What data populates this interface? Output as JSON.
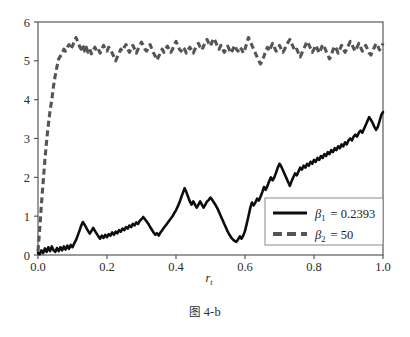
{
  "caption": {
    "prefix": "图",
    "text": "4-b"
  },
  "chart_data": {
    "type": "line",
    "title": "",
    "xlabel": "r_t",
    "xlabel_base": "r",
    "xlabel_sub": "t",
    "ylabel": "",
    "xlim": [
      0.0,
      1.0
    ],
    "ylim": [
      0,
      6
    ],
    "xticks": [
      0.0,
      0.2,
      0.4,
      0.6,
      0.8,
      1.0
    ],
    "xtick_labels": [
      "0.0",
      "0.2",
      "0.4",
      "0.6",
      "0.8",
      "1.0"
    ],
    "yticks": [
      0,
      1,
      2,
      3,
      4,
      5,
      6
    ],
    "ytick_labels": [
      "0",
      "1",
      "2",
      "3",
      "4",
      "5",
      "6"
    ],
    "grid": false,
    "legend_position": "lower right",
    "series": [
      {
        "name": "beta1",
        "label_base": "β",
        "label_sub": "1",
        "label_value": "= 0.2393",
        "label": "β₁ = 0.2393",
        "style": "solid",
        "color": "#0d0d0d",
        "x": [
          0.0,
          0.005,
          0.01,
          0.015,
          0.02,
          0.025,
          0.03,
          0.035,
          0.04,
          0.045,
          0.05,
          0.055,
          0.06,
          0.065,
          0.07,
          0.075,
          0.08,
          0.085,
          0.09,
          0.095,
          0.1,
          0.105,
          0.11,
          0.115,
          0.12,
          0.125,
          0.13,
          0.135,
          0.14,
          0.145,
          0.15,
          0.155,
          0.16,
          0.165,
          0.17,
          0.175,
          0.18,
          0.185,
          0.19,
          0.195,
          0.2,
          0.205,
          0.21,
          0.215,
          0.22,
          0.225,
          0.23,
          0.235,
          0.24,
          0.245,
          0.25,
          0.255,
          0.26,
          0.265,
          0.27,
          0.275,
          0.28,
          0.285,
          0.29,
          0.295,
          0.3,
          0.305,
          0.31,
          0.315,
          0.32,
          0.325,
          0.33,
          0.335,
          0.34,
          0.345,
          0.35,
          0.355,
          0.36,
          0.365,
          0.37,
          0.375,
          0.38,
          0.385,
          0.39,
          0.395,
          0.4,
          0.405,
          0.41,
          0.415,
          0.42,
          0.425,
          0.43,
          0.435,
          0.44,
          0.445,
          0.45,
          0.455,
          0.46,
          0.465,
          0.47,
          0.475,
          0.48,
          0.485,
          0.49,
          0.495,
          0.5,
          0.505,
          0.51,
          0.515,
          0.52,
          0.525,
          0.53,
          0.535,
          0.54,
          0.545,
          0.55,
          0.555,
          0.56,
          0.565,
          0.57,
          0.575,
          0.58,
          0.585,
          0.59,
          0.595,
          0.6,
          0.605,
          0.61,
          0.615,
          0.62,
          0.625,
          0.63,
          0.635,
          0.64,
          0.645,
          0.65,
          0.655,
          0.66,
          0.665,
          0.67,
          0.675,
          0.68,
          0.685,
          0.69,
          0.695,
          0.7,
          0.705,
          0.71,
          0.715,
          0.72,
          0.725,
          0.73,
          0.735,
          0.74,
          0.745,
          0.75,
          0.755,
          0.76,
          0.765,
          0.77,
          0.775,
          0.78,
          0.785,
          0.79,
          0.795,
          0.8,
          0.805,
          0.81,
          0.815,
          0.82,
          0.825,
          0.83,
          0.835,
          0.84,
          0.845,
          0.85,
          0.855,
          0.86,
          0.865,
          0.87,
          0.875,
          0.88,
          0.885,
          0.89,
          0.895,
          0.9,
          0.905,
          0.91,
          0.915,
          0.92,
          0.925,
          0.93,
          0.935,
          0.94,
          0.945,
          0.95,
          0.955,
          0.96,
          0.965,
          0.97,
          0.975,
          0.98,
          0.985,
          0.99,
          0.995,
          1.0
        ],
        "y": [
          0.06,
          0.02,
          0.12,
          0.05,
          0.17,
          0.08,
          0.2,
          0.1,
          0.22,
          0.12,
          0.08,
          0.18,
          0.1,
          0.2,
          0.12,
          0.22,
          0.14,
          0.24,
          0.16,
          0.26,
          0.2,
          0.3,
          0.38,
          0.5,
          0.62,
          0.75,
          0.85,
          0.78,
          0.7,
          0.62,
          0.55,
          0.62,
          0.7,
          0.62,
          0.55,
          0.48,
          0.42,
          0.5,
          0.44,
          0.52,
          0.46,
          0.54,
          0.5,
          0.58,
          0.52,
          0.6,
          0.56,
          0.64,
          0.6,
          0.68,
          0.64,
          0.72,
          0.68,
          0.76,
          0.72,
          0.8,
          0.76,
          0.84,
          0.8,
          0.88,
          0.92,
          0.98,
          0.92,
          0.86,
          0.8,
          0.72,
          0.65,
          0.58,
          0.52,
          0.56,
          0.5,
          0.58,
          0.64,
          0.7,
          0.76,
          0.82,
          0.88,
          0.94,
          1.0,
          1.08,
          1.15,
          1.25,
          1.35,
          1.48,
          1.6,
          1.72,
          1.62,
          1.5,
          1.38,
          1.3,
          1.38,
          1.3,
          1.22,
          1.3,
          1.38,
          1.3,
          1.22,
          1.3,
          1.38,
          1.42,
          1.48,
          1.42,
          1.35,
          1.28,
          1.2,
          1.1,
          1.0,
          0.9,
          0.8,
          0.7,
          0.6,
          0.52,
          0.45,
          0.4,
          0.36,
          0.34,
          0.4,
          0.48,
          0.42,
          0.5,
          0.62,
          0.8,
          1.0,
          1.2,
          1.35,
          1.28,
          1.35,
          1.45,
          1.4,
          1.5,
          1.62,
          1.75,
          1.68,
          1.78,
          1.9,
          2.0,
          1.92,
          2.0,
          2.12,
          2.25,
          2.35,
          2.28,
          2.18,
          2.08,
          1.98,
          1.88,
          1.78,
          1.9,
          2.0,
          2.1,
          2.05,
          2.15,
          2.25,
          2.2,
          2.3,
          2.25,
          2.35,
          2.3,
          2.4,
          2.35,
          2.45,
          2.4,
          2.5,
          2.45,
          2.55,
          2.5,
          2.6,
          2.55,
          2.65,
          2.6,
          2.7,
          2.65,
          2.75,
          2.7,
          2.8,
          2.75,
          2.85,
          2.8,
          2.9,
          2.85,
          2.95,
          3.0,
          2.95,
          3.05,
          3.1,
          3.05,
          3.15,
          3.2,
          3.15,
          3.25,
          3.35,
          3.45,
          3.55,
          3.48,
          3.4,
          3.3,
          3.22,
          3.3,
          3.45,
          3.6,
          3.68
        ]
      },
      {
        "name": "beta2",
        "label_base": "β",
        "label_sub": "2",
        "label_value": "= 50",
        "label": "β₂ = 50",
        "style": "dashed",
        "color": "#555555",
        "x": [
          0.0,
          0.004,
          0.008,
          0.012,
          0.016,
          0.02,
          0.024,
          0.028,
          0.032,
          0.036,
          0.04,
          0.045,
          0.05,
          0.055,
          0.06,
          0.065,
          0.07,
          0.075,
          0.08,
          0.085,
          0.09,
          0.095,
          0.1,
          0.105,
          0.11,
          0.115,
          0.12,
          0.125,
          0.13,
          0.135,
          0.14,
          0.145,
          0.15,
          0.155,
          0.16,
          0.165,
          0.17,
          0.175,
          0.18,
          0.185,
          0.19,
          0.195,
          0.2,
          0.205,
          0.21,
          0.215,
          0.22,
          0.225,
          0.23,
          0.235,
          0.24,
          0.245,
          0.25,
          0.255,
          0.26,
          0.265,
          0.27,
          0.275,
          0.28,
          0.285,
          0.29,
          0.295,
          0.3,
          0.305,
          0.31,
          0.315,
          0.32,
          0.325,
          0.33,
          0.335,
          0.34,
          0.345,
          0.35,
          0.355,
          0.36,
          0.365,
          0.37,
          0.375,
          0.38,
          0.385,
          0.39,
          0.395,
          0.4,
          0.405,
          0.41,
          0.415,
          0.42,
          0.425,
          0.43,
          0.435,
          0.44,
          0.445,
          0.45,
          0.455,
          0.46,
          0.465,
          0.47,
          0.475,
          0.48,
          0.485,
          0.49,
          0.495,
          0.5,
          0.505,
          0.51,
          0.515,
          0.52,
          0.525,
          0.53,
          0.535,
          0.54,
          0.545,
          0.55,
          0.555,
          0.56,
          0.565,
          0.57,
          0.575,
          0.58,
          0.585,
          0.59,
          0.595,
          0.6,
          0.605,
          0.61,
          0.615,
          0.62,
          0.625,
          0.63,
          0.635,
          0.64,
          0.645,
          0.65,
          0.655,
          0.66,
          0.665,
          0.67,
          0.675,
          0.68,
          0.685,
          0.69,
          0.695,
          0.7,
          0.705,
          0.71,
          0.715,
          0.72,
          0.725,
          0.73,
          0.735,
          0.74,
          0.745,
          0.75,
          0.755,
          0.76,
          0.765,
          0.77,
          0.775,
          0.78,
          0.785,
          0.79,
          0.795,
          0.8,
          0.805,
          0.81,
          0.815,
          0.82,
          0.825,
          0.83,
          0.835,
          0.84,
          0.845,
          0.85,
          0.855,
          0.86,
          0.865,
          0.87,
          0.875,
          0.88,
          0.885,
          0.89,
          0.895,
          0.9,
          0.905,
          0.91,
          0.915,
          0.92,
          0.925,
          0.93,
          0.935,
          0.94,
          0.945,
          0.95,
          0.955,
          0.96,
          0.965,
          0.97,
          0.975,
          0.98,
          0.985,
          0.99,
          0.995,
          1.0
        ],
        "y": [
          0.1,
          0.55,
          1.05,
          1.55,
          2.0,
          2.45,
          2.85,
          3.2,
          3.5,
          3.78,
          4.0,
          4.35,
          4.62,
          4.85,
          5.05,
          5.12,
          5.2,
          5.3,
          5.25,
          5.35,
          5.42,
          5.3,
          5.38,
          5.5,
          5.6,
          5.5,
          5.38,
          5.3,
          5.4,
          5.25,
          5.35,
          5.22,
          5.3,
          5.18,
          5.28,
          5.35,
          5.25,
          5.3,
          5.2,
          5.3,
          5.4,
          5.3,
          5.25,
          5.35,
          5.28,
          5.2,
          5.1,
          5.0,
          5.1,
          5.2,
          5.3,
          5.25,
          5.35,
          5.42,
          5.3,
          5.22,
          5.3,
          5.4,
          5.3,
          5.2,
          5.3,
          5.4,
          5.48,
          5.4,
          5.3,
          5.25,
          5.35,
          5.42,
          5.3,
          5.2,
          5.12,
          5.02,
          5.12,
          5.2,
          5.3,
          5.22,
          5.3,
          5.38,
          5.3,
          5.22,
          5.3,
          5.42,
          5.5,
          5.4,
          5.3,
          5.25,
          5.35,
          5.3,
          5.2,
          5.28,
          5.35,
          5.28,
          5.2,
          5.3,
          5.38,
          5.45,
          5.35,
          5.28,
          5.38,
          5.48,
          5.55,
          5.45,
          5.38,
          5.5,
          5.58,
          5.48,
          5.38,
          5.3,
          5.4,
          5.3,
          5.22,
          5.3,
          5.38,
          5.28,
          5.2,
          5.3,
          5.4,
          5.3,
          5.25,
          5.35,
          5.3,
          5.2,
          5.3,
          5.45,
          5.6,
          5.5,
          5.4,
          5.3,
          5.2,
          5.1,
          5.0,
          4.92,
          5.0,
          5.12,
          5.25,
          5.35,
          5.25,
          5.35,
          5.45,
          5.35,
          5.25,
          5.3,
          5.4,
          5.3,
          5.22,
          5.3,
          5.4,
          5.48,
          5.55,
          5.45,
          5.35,
          5.25,
          5.3,
          5.2,
          5.1,
          5.2,
          5.3,
          5.4,
          5.5,
          5.42,
          5.32,
          5.22,
          5.3,
          5.4,
          5.3,
          5.2,
          5.3,
          5.42,
          5.35,
          5.25,
          5.15,
          5.05,
          5.15,
          5.28,
          5.38,
          5.3,
          5.2,
          5.3,
          5.4,
          5.3,
          5.22,
          5.3,
          5.4,
          5.5,
          5.42,
          5.32,
          5.25,
          5.35,
          5.45,
          5.35,
          5.25,
          5.3,
          5.4,
          5.3,
          5.2,
          5.15,
          5.25,
          5.35,
          5.45,
          5.38,
          5.28,
          5.35,
          5.45
        ]
      }
    ]
  }
}
